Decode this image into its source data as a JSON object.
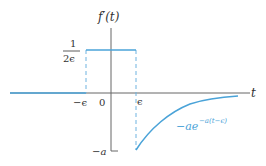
{
  "diagram": {
    "y_axis_label": "f′(t)",
    "x_axis_label": "t",
    "pulse_height_label_num": "1",
    "pulse_height_label_den": "2ϵ",
    "tick_neg_eps": "−ϵ",
    "tick_zero": "0",
    "tick_eps": "ϵ",
    "tick_neg_a": "−a",
    "curve_label_base": "−ae",
    "curve_label_exp": "−a(t−ϵ)",
    "colors": {
      "curve": "#4aa3d8",
      "axis": "#555555",
      "dashed": "#6fb3e0",
      "text": "#333333"
    }
  }
}
